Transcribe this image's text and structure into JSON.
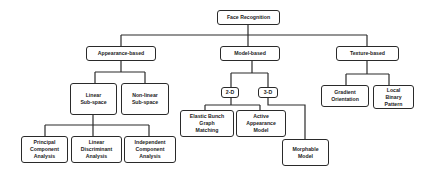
{
  "diagram": {
    "type": "tree",
    "root": "Face Recognition",
    "nodes": {
      "root": "Face Recognition",
      "appearance": "Appearance-based",
      "model": "Model-based",
      "texture": "Texture-based",
      "linear": "Linear\nSub-space",
      "nonlinear": "Non-linear\nSub-space",
      "pca": "Principal\nComponent\nAnalysis",
      "lda": "Linear\nDiscriminant\nAnalysis",
      "ica": "Independent\nComponent\nAnalysis",
      "d2": "2-D",
      "d3": "3-D",
      "ebgm": "Elastic Bunch\nGraph\nMatching",
      "aam": "Active\nAppearance\nModel",
      "morph": "Morphable\nModel",
      "gradient": "Gradient\nOrientation",
      "lbp": "Local\nBinary\nPattern"
    },
    "edges": [
      [
        "Face Recognition",
        "Appearance-based"
      ],
      [
        "Face Recognition",
        "Model-based"
      ],
      [
        "Face Recognition",
        "Texture-based"
      ],
      [
        "Appearance-based",
        "Linear Sub-space"
      ],
      [
        "Appearance-based",
        "Non-linear Sub-space"
      ],
      [
        "Linear Sub-space",
        "Principal Component Analysis"
      ],
      [
        "Linear Sub-space",
        "Linear Discriminant Analysis"
      ],
      [
        "Linear Sub-space",
        "Independent Component Analysis"
      ],
      [
        "Model-based",
        "2-D"
      ],
      [
        "Model-based",
        "3-D"
      ],
      [
        "2-D",
        "Elastic Bunch Graph Matching"
      ],
      [
        "2-D",
        "Active Appearance Model"
      ],
      [
        "3-D",
        "Morphable Model"
      ],
      [
        "Texture-based",
        "Gradient Orientation"
      ],
      [
        "Texture-based",
        "Local Binary Pattern"
      ]
    ]
  }
}
